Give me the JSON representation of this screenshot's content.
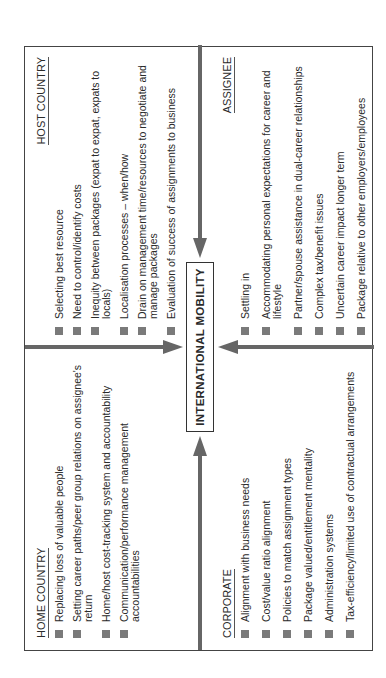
{
  "title": "INTERNATIONAL MOBILITY",
  "colors": {
    "border": "#444444",
    "arrow": "#666666",
    "bullet": "#7a7a7a",
    "text": "#2a2a2a"
  },
  "quadrants": {
    "home_country": {
      "header": "HOME COUNTRY",
      "items": [
        "Replacing loss of valuable people",
        "Setting career paths/peer group relations on assignee's return",
        "Home/host cost-tracking system and accountability",
        "Communication/performance management accountabilities"
      ]
    },
    "host_country": {
      "header": "HOST COUNTRY",
      "items": [
        "Selecting best resource",
        "Need to control/identify costs",
        "Inequity between packages (expat to expat, expats to locals)",
        "Localisation processes – when/how",
        "Drain on management time/resources to negotiate and manage packages",
        "Evaluation of success of assignments to business"
      ]
    },
    "corporate": {
      "header": "CORPORATE",
      "items": [
        "Alignment with business needs",
        "Cost/value ratio alignment",
        "Policies to match assignment types",
        "Package valued/entitlement mentality",
        "Administration systems",
        "Tax-efficiency/limited use of contractual arrangements"
      ]
    },
    "assignee": {
      "header": "ASSIGNEE",
      "items": [
        "Settling in",
        "Accommodating personal expectations for career and lifestyle",
        "Partner/spouse assistance in dual-career relationships",
        "Complex tax/benefit issues",
        "Uncertain career impact longer term",
        "Package relative to other employers/employees"
      ]
    }
  }
}
